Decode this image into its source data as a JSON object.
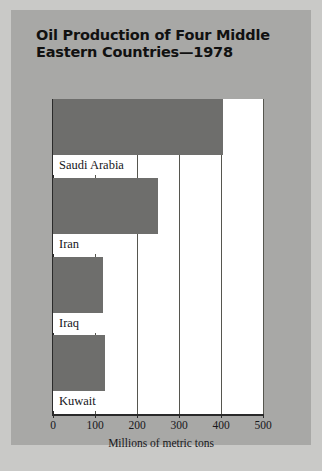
{
  "figure": {
    "card_color": "#a8a8a6",
    "page_color": "#c9c9c7",
    "bar_color": "#6e6e6c",
    "plot_color": "#ffffff"
  },
  "chart_data": {
    "type": "bar",
    "orientation": "horizontal",
    "title": "Oil Production of Four Middle Eastern Countries—1978",
    "categories": [
      "Saudi Arabia",
      "Iran",
      "Iraq",
      "Kuwait"
    ],
    "values": [
      405,
      250,
      120,
      123
    ],
    "xlabel": "Millions of metric tons",
    "ylabel": "",
    "xlim": [
      0,
      500
    ],
    "xticks": [
      0,
      100,
      200,
      300,
      400,
      500
    ],
    "xtick_labels": [
      "0",
      "100",
      "200",
      "300",
      "400",
      "500"
    ],
    "grid": true,
    "grid_axis": "x",
    "legend": false,
    "series": [
      {
        "name": "Oil production",
        "values": [
          405,
          250,
          120,
          123
        ]
      }
    ]
  }
}
